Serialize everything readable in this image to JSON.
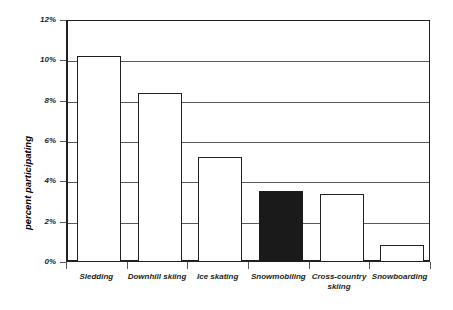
{
  "chart_data": {
    "type": "bar",
    "title": "",
    "subtitle": "",
    "xlabel": "",
    "ylabel": "percent participating",
    "categories": [
      "Sledding",
      "Downhill skiing",
      "Ice skating",
      "Snowmobiling",
      "Cross-country skiing",
      "Snowboarding"
    ],
    "values": [
      10.2,
      8.4,
      5.2,
      3.5,
      3.35,
      0.85
    ],
    "value_unit": "percent",
    "ylim": [
      0,
      12
    ],
    "ytick_values": [
      0,
      2,
      4,
      6,
      8,
      10,
      12
    ],
    "ytick_labels": [
      "0%",
      "2%",
      "4%",
      "6%",
      "8%",
      "10%",
      "12%"
    ],
    "grid": true,
    "grid_axis": "y",
    "legend": false,
    "legend_position": "none",
    "highlighted_category": "Snowmobiling",
    "bar_fill_default": "#ffffff",
    "bar_fill_highlight": "#1a1a1a",
    "bar_edge_color": "#231f20",
    "grid_color": "#58595b",
    "axis_color": "#231f20",
    "background_color": "#ffffff",
    "annotations": []
  },
  "axes": {
    "y_title": "percent participating",
    "y_ticks": [
      {
        "label": "12%",
        "value": 12
      },
      {
        "label": "10%",
        "value": 10
      },
      {
        "label": "8%",
        "value": 8
      },
      {
        "label": "6%",
        "value": 6
      },
      {
        "label": "4%",
        "value": 4
      },
      {
        "label": "2%",
        "value": 2
      },
      {
        "label": "0%",
        "value": 0
      }
    ],
    "x_labels": [
      "Sledding",
      "Downhill skiing",
      "Ice skating",
      "Snowmobiling",
      "Cross-country\nskiing",
      "Snowboarding"
    ]
  }
}
